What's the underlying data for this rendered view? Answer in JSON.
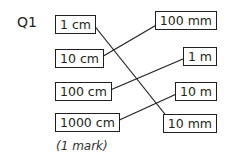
{
  "question": {
    "number": "Q1",
    "left_items": [
      {
        "label": "1 cm",
        "x": 55,
        "y": 15
      },
      {
        "label": "10 cm",
        "x": 55,
        "y": 49
      },
      {
        "label": "100 cm",
        "x": 55,
        "y": 82
      },
      {
        "label": "1000 cm",
        "x": 55,
        "y": 113
      }
    ],
    "right_items": [
      {
        "label": "100 mm",
        "right": 17,
        "y": 11
      },
      {
        "label": "1 m",
        "right": 17,
        "y": 47
      },
      {
        "label": "10 m",
        "right": 17,
        "y": 82
      },
      {
        "label": "10 mm",
        "right": 17,
        "y": 114
      }
    ],
    "matches": [
      {
        "from": "1 cm",
        "to": "10 mm"
      },
      {
        "from": "10 cm",
        "to": "100 mm"
      },
      {
        "from": "100 cm",
        "to": "1 m"
      },
      {
        "from": "1000 cm",
        "to": "10 m"
      }
    ],
    "marks": "(1 mark)"
  }
}
